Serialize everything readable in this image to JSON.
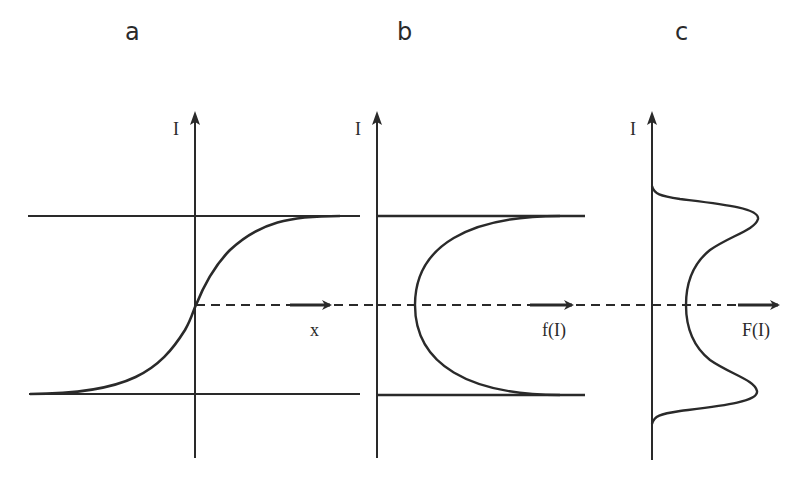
{
  "panels": [
    {
      "id": "a",
      "label": "a",
      "y_axis_label": "I",
      "x_axis_label": "x",
      "description": "sigmoid intensity profile I(x) bounded by two saturation levels"
    },
    {
      "id": "b",
      "label": "b",
      "y_axis_label": "I",
      "x_axis_label": "f(I)",
      "description": "C-shaped function f(I) approaching the upper and lower levels"
    },
    {
      "id": "c",
      "label": "c",
      "y_axis_label": "I",
      "x_axis_label": "F(I)",
      "description": "bimodal distribution F(I) with peaks at the two saturation levels"
    }
  ],
  "colors": {
    "ink": "#2a2a2a",
    "background": "#ffffff"
  }
}
